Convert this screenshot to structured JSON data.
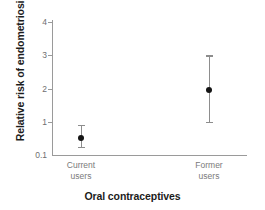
{
  "chart_data": {
    "type": "scatter",
    "title": "",
    "xlabel": "Oral contraceptives",
    "ylabel": "Relative risk of endometriosis",
    "categories": [
      "Current users",
      "Former users"
    ],
    "category_lines": [
      [
        "Current",
        "users"
      ],
      [
        "Former",
        "users"
      ]
    ],
    "yticks": [
      0.1,
      1,
      2,
      3,
      4
    ],
    "ytick_labels": [
      "0.1",
      "1",
      "2",
      "3",
      "4"
    ],
    "ylim": [
      0.1,
      4
    ],
    "grid": false,
    "legend": null,
    "series": [
      {
        "name": "Relative risk",
        "points": [
          {
            "category": "Current users",
            "x": 1,
            "value": 0.5,
            "ci_low": 0.25,
            "ci_high": 0.9
          },
          {
            "category": "Former users",
            "x": 2,
            "value": 1.95,
            "ci_low": 1.0,
            "ci_high": 3.0
          }
        ]
      }
    ],
    "marker_color": "#141414",
    "errorbar_color": "#8d8d8d",
    "axis_color": "#9a9a9a",
    "tick_label_color": "#6f6f6f",
    "axis_title_color": "#1c1c1c"
  }
}
